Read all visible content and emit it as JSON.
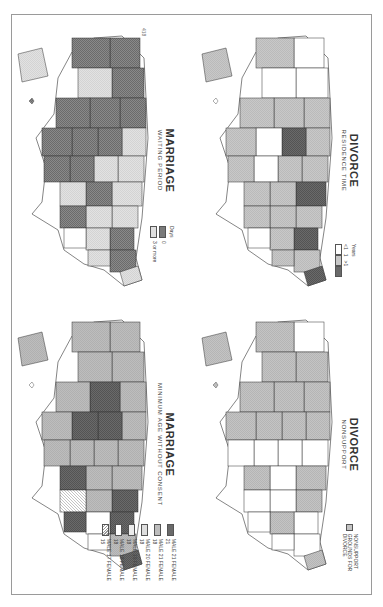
{
  "page": {
    "page_number": "418",
    "orientation": "rotated-90-clockwise"
  },
  "colors": {
    "dark": "#6e6e6e",
    "medium": "#b9b9b9",
    "light": "#dcdcdc",
    "white": "#ffffff",
    "hatch": "#cfcfcf",
    "border": "#3a3a3a"
  },
  "maps": [
    {
      "id": "marriage-waiting-period",
      "title": "MARRIAGE",
      "subtitle": "WAITING PERIOD",
      "legend": {
        "heading": "Days",
        "items": [
          {
            "label": "0",
            "fill": "dark"
          },
          {
            "label": "3 or more",
            "fill": "light"
          }
        ]
      }
    },
    {
      "id": "marriage-minimum-age",
      "title": "MARRIAGE",
      "subtitle": "MINIMUM AGE WITHOUT CONSENT",
      "legend": {
        "heading": "",
        "items": [
          {
            "label": "MALE 21 FEMALE 21",
            "fill": "dark"
          },
          {
            "label": "MALE 21 FEMALE 18",
            "fill": "medium"
          },
          {
            "label": "MALE 20 FEMALE 18",
            "fill": "light"
          },
          {
            "label": "MALE 19 FEMALE 18",
            "fill": "light"
          },
          {
            "label": "MALE 18 FEMALE 18",
            "fill": "white"
          },
          {
            "label": "MALE 17 FEMALE 15",
            "fill": "hatch"
          }
        ]
      }
    },
    {
      "id": "divorce-residence-time",
      "title": "DIVORCE",
      "subtitle": "RESIDENCE TIME",
      "legend": {
        "heading": "Years",
        "items": [
          {
            "label": "<1",
            "fill": "white"
          },
          {
            "label": "1",
            "fill": "medium"
          },
          {
            "label": ">1",
            "fill": "dark"
          }
        ]
      }
    },
    {
      "id": "divorce-nonsupport",
      "title": "DIVORCE",
      "subtitle": "NONSUPPORT",
      "legend": {
        "heading": "",
        "items": [
          {
            "label": "NONSUPPORT GROUNDS FOR DIVORCE",
            "fill": "medium"
          }
        ]
      }
    }
  ]
}
